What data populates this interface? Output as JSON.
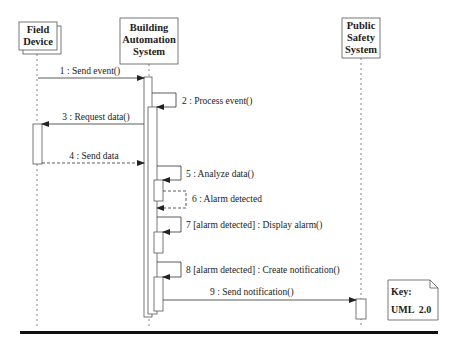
{
  "diagram": {
    "type": "UML sequence diagram",
    "participants": [
      {
        "id": "field_device",
        "lines": [
          "Field",
          "Device"
        ]
      },
      {
        "id": "bas",
        "lines": [
          "Building",
          "Automation",
          "System"
        ]
      },
      {
        "id": "pss",
        "lines": [
          "Public",
          "Safety",
          "System"
        ]
      }
    ],
    "messages": [
      {
        "label": "1 : Send event()",
        "from": "field_device",
        "to": "bas",
        "style": "sync"
      },
      {
        "label": "2 : Process event()",
        "from": "bas",
        "to": "bas",
        "style": "self"
      },
      {
        "label": "3 : Request data()",
        "from": "bas",
        "to": "field_device",
        "style": "sync"
      },
      {
        "label": "4 : Send data",
        "from": "field_device",
        "to": "bas",
        "style": "return"
      },
      {
        "label": "5 : Analyze data()",
        "from": "bas",
        "to": "bas",
        "style": "self"
      },
      {
        "label": "6 : Alarm detected",
        "from": "bas",
        "to": "bas",
        "style": "self-return"
      },
      {
        "label": "7 [alarm detected] : Display alarm()",
        "from": "bas",
        "to": "bas",
        "style": "self"
      },
      {
        "label": "8 [alarm detected] : Create notification()",
        "from": "bas",
        "to": "bas",
        "style": "self"
      },
      {
        "label": "9 : Send notification()",
        "from": "bas",
        "to": "pss",
        "style": "sync"
      }
    ],
    "key_note": {
      "line1": "Key:",
      "line2": "UML  2.0"
    }
  },
  "colors": {
    "line": "#333333",
    "text": "#222222",
    "background": "#ffffff",
    "rule": "#111111"
  }
}
